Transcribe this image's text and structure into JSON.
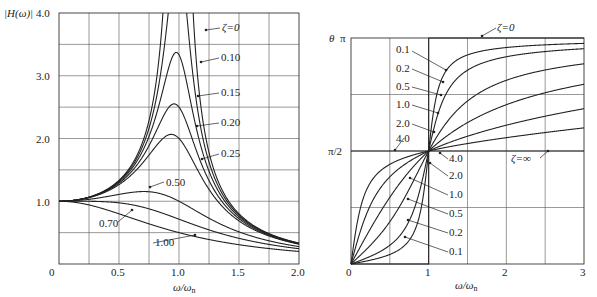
{
  "chart_data": [
    {
      "type": "line",
      "title": "",
      "xlabel": "ω/ωn",
      "ylabel": "|H(ω)|",
      "xlim": [
        0,
        2.0
      ],
      "ylim": [
        0,
        4.0
      ],
      "xticks": [
        "0",
        "0.5",
        "1.0",
        "1.5",
        "2.0"
      ],
      "yticks": [
        "1.0",
        "2.0",
        "3.0",
        "4.0"
      ],
      "grid": true,
      "formula": "|H| = 1 / sqrt((1-r^2)^2 + (2*zeta*r)^2)",
      "series": [
        {
          "name": "ζ=0",
          "zeta": 0,
          "label": "ζ=0"
        },
        {
          "name": "0.10",
          "zeta": 0.1,
          "label": "0.10"
        },
        {
          "name": "0.15",
          "zeta": 0.15,
          "label": "0.15"
        },
        {
          "name": "0.20",
          "zeta": 0.2,
          "label": "0.20"
        },
        {
          "name": "0.25",
          "zeta": 0.25,
          "label": "0.25"
        },
        {
          "name": "0.50",
          "zeta": 0.5,
          "label": "0.50"
        },
        {
          "name": "0.70",
          "zeta": 0.7,
          "label": "0.70"
        },
        {
          "name": "1.00",
          "zeta": 1.0,
          "label": "1.00"
        }
      ]
    },
    {
      "type": "line",
      "title": "",
      "xlabel": "ω/ωn",
      "ylabel": "θ",
      "xlim": [
        0,
        3
      ],
      "ylim": [
        0,
        3.14159
      ],
      "xticks": [
        "0",
        "1",
        "2",
        "3"
      ],
      "yticks": [
        "π/2",
        "π"
      ],
      "grid": true,
      "formula": "θ = atan2(2*zeta*r, 1-r^2)",
      "series": [
        {
          "name": "ζ=0",
          "zeta": 0,
          "label": "ζ=0"
        },
        {
          "name": "0.1",
          "zeta": 0.1,
          "label": "0.1"
        },
        {
          "name": "0.2",
          "zeta": 0.2,
          "label": "0.2"
        },
        {
          "name": "0.5",
          "zeta": 0.5,
          "label": "0.5"
        },
        {
          "name": "1.0",
          "zeta": 1.0,
          "label": "1.0"
        },
        {
          "name": "2.0",
          "zeta": 2.0,
          "label": "2.0"
        },
        {
          "name": "4.0",
          "zeta": 4.0,
          "label": "4.0"
        },
        {
          "name": "ζ=∞",
          "zeta": "inf",
          "label": "ζ=∞"
        }
      ]
    }
  ],
  "left": {
    "ylabel": "|H(ω)|",
    "xlabel": "ω/ω",
    "xlabel_sub": "n",
    "ticks_x": [
      "0",
      "0.5",
      "1.0",
      "1.5",
      "2.0"
    ],
    "ticks_y": [
      "1.0",
      "2.0",
      "3.0",
      "4.0"
    ],
    "labels": [
      "ζ=0",
      "0.10",
      "0.15",
      "0.20",
      "0.25",
      "0.50",
      "0.70",
      "1.00"
    ]
  },
  "right": {
    "ylabel": "θ",
    "y_pi": "π",
    "y_half_pi": "π/2",
    "xlabel": "ω/ω",
    "xlabel_sub": "n",
    "ticks_x": [
      "0",
      "1",
      "2",
      "3"
    ],
    "labels_upper": [
      "0.1",
      "0.2",
      "0.5",
      "1.0",
      "2.0",
      "4.0"
    ],
    "labels_lower": [
      "4.0",
      "2.0",
      "1.0",
      "0.5",
      "0.2",
      "0.1"
    ],
    "label_zero": "ζ=0",
    "label_inf": "ζ=∞"
  }
}
